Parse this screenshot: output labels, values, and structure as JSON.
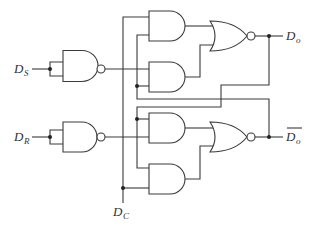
{
  "diagram": {
    "colors": {
      "line": "#3a3a3a",
      "background": "#ffffff",
      "junction": "#222222"
    },
    "labels": {
      "ds": {
        "main": "D",
        "sub": "S"
      },
      "dr": {
        "main": "D",
        "sub": "R"
      },
      "dc": {
        "main": "D",
        "sub": "C"
      },
      "qo": {
        "main": "D",
        "sub": "o"
      },
      "qo_bar": {
        "main": "D",
        "sub": "o",
        "overbar": true
      }
    },
    "gates": [
      {
        "id": "nand-s",
        "type": "NAND",
        "inputs": 2
      },
      {
        "id": "nand-r",
        "type": "NAND",
        "inputs": 2
      },
      {
        "id": "and-1",
        "type": "AND",
        "inputs": 2
      },
      {
        "id": "and-2",
        "type": "AND",
        "inputs": 2
      },
      {
        "id": "and-3",
        "type": "AND",
        "inputs": 2
      },
      {
        "id": "and-4",
        "type": "AND",
        "inputs": 2
      },
      {
        "id": "nor-top",
        "type": "NOR",
        "inputs": 2
      },
      {
        "id": "nor-bottom",
        "type": "NOR",
        "inputs": 2
      }
    ]
  }
}
